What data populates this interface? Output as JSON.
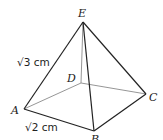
{
  "diagram": {
    "type": "square pyramid",
    "vertices": {
      "A": {
        "label": "A",
        "x": 24,
        "y": 109
      },
      "B": {
        "label": "B",
        "x": 94,
        "y": 131
      },
      "C": {
        "label": "C",
        "x": 146,
        "y": 94
      },
      "D": {
        "label": "D",
        "x": 81,
        "y": 83
      },
      "E": {
        "label": "E",
        "x": 83,
        "y": 22
      }
    },
    "measurements": {
      "AE": "√3 cm",
      "AB": "√2 cm"
    },
    "edges_visible": [
      "AE",
      "BE",
      "CE",
      "AB",
      "BC"
    ],
    "edges_hidden": [
      "AD",
      "DC",
      "DE"
    ]
  }
}
